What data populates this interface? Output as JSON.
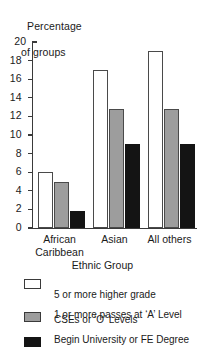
{
  "chart_data": {
    "type": "bar",
    "title": "",
    "ylabel": "Percentage\nof groups",
    "ylabel_lines": [
      "Percentage",
      "of groups"
    ],
    "xlabel": "Ethnic Group",
    "categories": [
      "African\nCaribbean",
      "Asian",
      "All others"
    ],
    "category_labels": [
      {
        "line1": "African",
        "line2": "Caribbean"
      },
      {
        "line1": "Asian",
        "line2": ""
      },
      {
        "line1": "All others",
        "line2": ""
      }
    ],
    "ylim": [
      0,
      20
    ],
    "ytick_step": 2,
    "ytick_labels": [
      "20",
      "18",
      "16",
      "14",
      "12",
      "10",
      "8",
      "6",
      "4",
      "2",
      "0"
    ],
    "ytick_values": [
      20,
      18,
      16,
      14,
      12,
      10,
      8,
      6,
      4,
      2,
      0
    ],
    "grid": false,
    "legend_position": "below",
    "series": [
      {
        "name": "5 or more higher grade\nCSEs or 'O' Levels",
        "name_lines": [
          "5 or more higher grade",
          "CSEs or ‘O’ Levels"
        ],
        "color": "#ffffff",
        "edge_color": "#4a4a4a",
        "values": [
          6,
          17,
          19
        ]
      },
      {
        "name": "1 or more passes at 'A' Level",
        "name_lines": [
          "1 or more passes at ‘A’ Level",
          ""
        ],
        "color": "#9d9d9d",
        "edge_color": "#4a4a4a",
        "values": [
          5,
          12.8,
          12.8
        ]
      },
      {
        "name": "Begin University or FE Degree",
        "name_lines": [
          "Begin University or FE Degree",
          ""
        ],
        "color": "#141414",
        "edge_color": "#141414",
        "values": [
          1.8,
          9,
          9
        ]
      }
    ]
  }
}
